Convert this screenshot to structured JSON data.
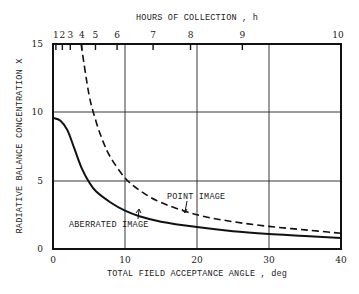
{
  "chart_data": {
    "type": "line",
    "title": "",
    "xlabel": "TOTAL FIELD ACCEPTANCE ANGLE , deg",
    "ylabel": "RADIATIVE BALANCE CONCENTRATION X",
    "top_xlabel": "HOURS OF COLLECTION , h",
    "xlim": [
      0,
      40
    ],
    "ylim": [
      0,
      15
    ],
    "grid": true,
    "x_ticks": [
      "0",
      "10",
      "20",
      "30",
      "40"
    ],
    "y_ticks": [
      "0",
      "5",
      "10",
      "15"
    ],
    "top_ticks": [
      {
        "label": "1",
        "x": 0.4
      },
      {
        "label": "2",
        "x": 1.3
      },
      {
        "label": "3",
        "x": 2.4
      },
      {
        "label": "4",
        "x": 4.0
      },
      {
        "label": "5",
        "x": 5.9
      },
      {
        "label": "6",
        "x": 8.9
      },
      {
        "label": "7",
        "x": 13.9
      },
      {
        "label": "8",
        "x": 19.1
      },
      {
        "label": "9",
        "x": 26.3
      },
      {
        "label": "10",
        "x": 40
      }
    ],
    "series": [
      {
        "name": "ABERRATED IMAGE",
        "style": "solid",
        "x": [
          0,
          1,
          2,
          3,
          4,
          5,
          6,
          8,
          10,
          12,
          15,
          20,
          25,
          30,
          35,
          40
        ],
        "y": [
          9.6,
          9.4,
          8.7,
          7.3,
          5.9,
          4.9,
          4.2,
          3.4,
          2.8,
          2.4,
          2.0,
          1.6,
          1.3,
          1.1,
          0.95,
          0.8
        ]
      },
      {
        "name": "POINT IMAGE",
        "style": "dashed",
        "x": [
          3.9,
          5,
          6,
          7,
          8,
          10,
          12,
          15,
          20,
          25,
          30,
          35,
          40
        ],
        "y": [
          15,
          11.3,
          9.3,
          7.8,
          6.7,
          5.2,
          4.3,
          3.4,
          2.5,
          2.0,
          1.65,
          1.4,
          1.15
        ]
      }
    ],
    "annotations": [
      {
        "text": "POINT IMAGE",
        "points_to": "dashed curve near x=18"
      },
      {
        "text": "ABERRATED IMAGE",
        "points_to": "solid curve near x=11"
      }
    ]
  }
}
